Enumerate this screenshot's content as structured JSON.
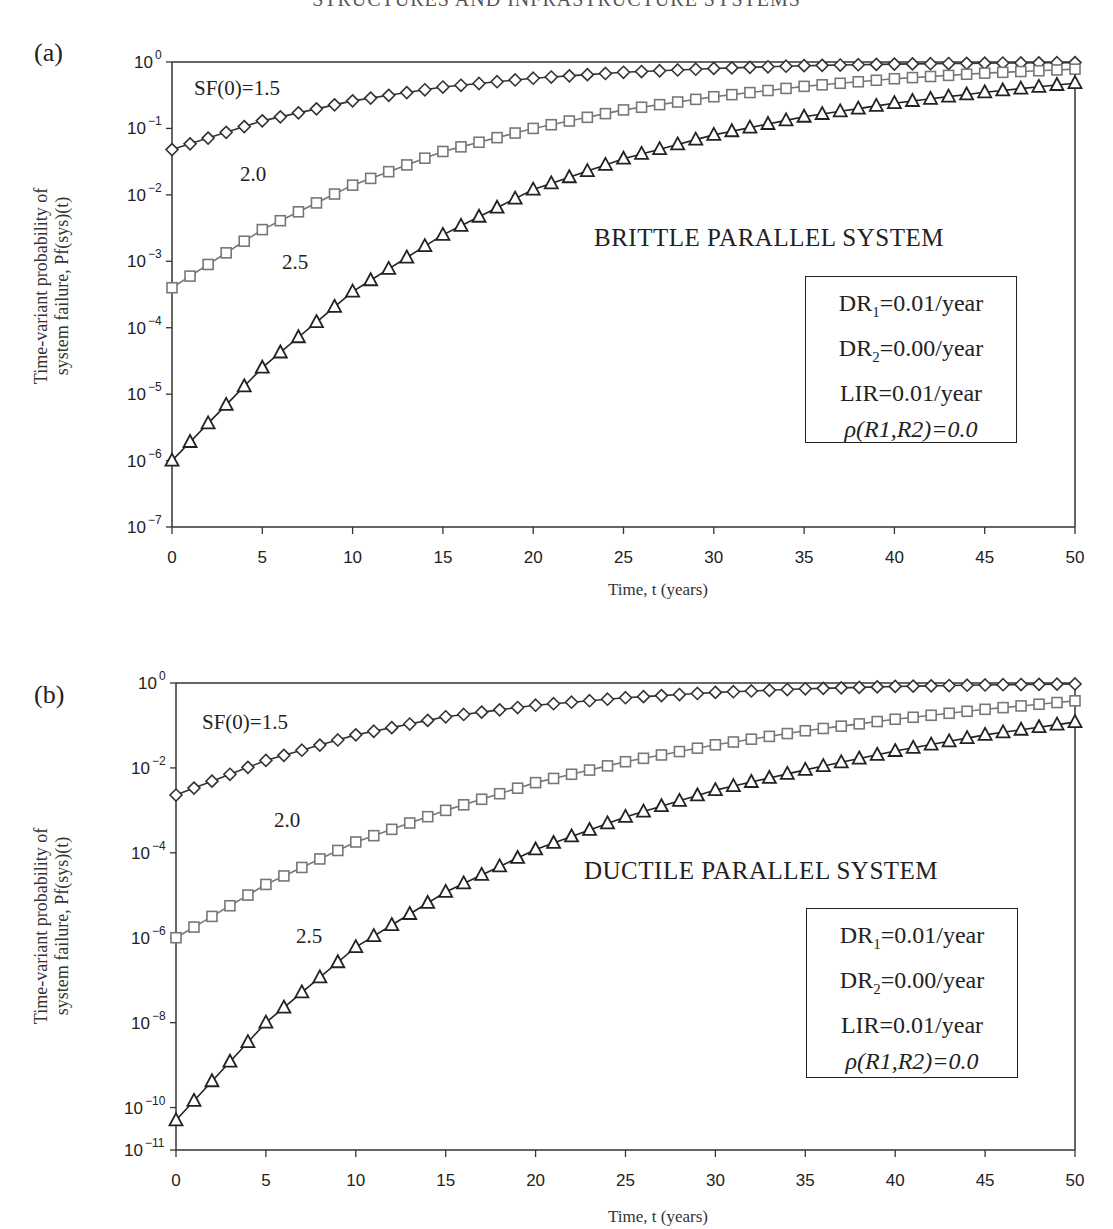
{
  "header": {
    "running_title": "STRUCTURES AND INFRASTRUCTURE SYSTEMS"
  },
  "panels": [
    {
      "id": "a",
      "label": "(a)",
      "system_title": "BRITTLE PARALLEL SYSTEM",
      "ylabel_line1": "Time-variant probability of",
      "ylabel_line2": "system failure, Pf(sys)(t)",
      "xlabel": "Time, t (years)",
      "series_labels": [
        "SF(0)=1.5",
        "2.0",
        "2.5"
      ],
      "params": {
        "dr1_prefix": "DR",
        "dr1_sub": "1",
        "dr1_value": "=0.01/year",
        "dr2_prefix": "DR",
        "dr2_sub": "2",
        "dr2_value": "=0.00/year",
        "lir": "LIR=0.01/year",
        "rho": "ρ(R1,R2)=0.0"
      },
      "yticks": [
        "10^0",
        "10^-1",
        "10^-2",
        "10^-3",
        "10^-4",
        "10^-5",
        "10^-6",
        "10^-7"
      ],
      "xticks": [
        "0",
        "5",
        "10",
        "15",
        "20",
        "25",
        "30",
        "35",
        "40",
        "45",
        "50"
      ]
    },
    {
      "id": "b",
      "label": "(b)",
      "system_title": "DUCTILE PARALLEL SYSTEM",
      "ylabel_line1": "Time-variant probability of",
      "ylabel_line2": "system failure, Pf(sys)(t)",
      "xlabel": "Time, t (years)",
      "series_labels": [
        "SF(0)=1.5",
        "2.0",
        "2.5"
      ],
      "params": {
        "dr1_prefix": "DR",
        "dr1_sub": "1",
        "dr1_value": "=0.01/year",
        "dr2_prefix": "DR",
        "dr2_sub": "2",
        "dr2_value": "=0.00/year",
        "lir": "LIR=0.01/year",
        "rho": "ρ(R1,R2)=0.0"
      },
      "yticks": [
        "10^0",
        "10^-2",
        "10^-4",
        "10^-6",
        "10^-8",
        "10^-10",
        "10^-11"
      ],
      "xticks": [
        "0",
        "5",
        "10",
        "15",
        "20",
        "25",
        "30",
        "35",
        "40",
        "45",
        "50"
      ]
    }
  ],
  "chart_data": [
    {
      "type": "line",
      "title": "(a) BRITTLE PARALLEL SYSTEM",
      "xlabel": "Time, t (years)",
      "ylabel": "Time-variant probability of system failure, Pf(sys)(t)",
      "yscale": "log",
      "xlim": [
        0,
        50
      ],
      "ylim": [
        1e-07,
        1
      ],
      "grid": false,
      "legend": "inline labels",
      "annotations": [
        "BRITTLE PARALLEL SYSTEM",
        "DR1=0.01/year",
        "DR2=0.00/year",
        "LIR=0.01/year",
        "ρ(R1,R2)=0.0"
      ],
      "x": [
        0,
        5,
        10,
        15,
        20,
        25,
        30,
        35,
        40,
        45,
        50
      ],
      "series": [
        {
          "name": "SF(0)=1.5",
          "marker": "diamond",
          "color": "#333333",
          "values": [
            0.048,
            0.13,
            0.26,
            0.42,
            0.57,
            0.7,
            0.8,
            0.88,
            0.93,
            0.96,
            0.98
          ]
        },
        {
          "name": "SF(0)=2.0",
          "marker": "square",
          "color": "#777777",
          "values": [
            0.0004,
            0.003,
            0.014,
            0.045,
            0.1,
            0.19,
            0.3,
            0.43,
            0.56,
            0.68,
            0.78
          ]
        },
        {
          "name": "SF(0)=2.5",
          "marker": "triangle",
          "color": "#222222",
          "values": [
            1e-06,
            2.5e-05,
            0.00035,
            0.0025,
            0.012,
            0.035,
            0.08,
            0.15,
            0.24,
            0.35,
            0.48
          ]
        }
      ]
    },
    {
      "type": "line",
      "title": "(b) DUCTILE PARALLEL SYSTEM",
      "xlabel": "Time, t (years)",
      "ylabel": "Time-variant probability of system failure, Pf(sys)(t)",
      "yscale": "log",
      "xlim": [
        0,
        50
      ],
      "ylim": [
        1e-11,
        1
      ],
      "grid": false,
      "legend": "inline labels",
      "annotations": [
        "DUCTILE PARALLEL SYSTEM",
        "DR1=0.01/year",
        "DR2=0.00/year",
        "LIR=0.01/year",
        "ρ(R1,R2)=0.0"
      ],
      "x": [
        0,
        5,
        10,
        15,
        20,
        25,
        30,
        35,
        40,
        45,
        50
      ],
      "series": [
        {
          "name": "SF(0)=1.5",
          "marker": "diamond",
          "color": "#333333",
          "values": [
            0.0023,
            0.015,
            0.06,
            0.16,
            0.3,
            0.45,
            0.6,
            0.73,
            0.83,
            0.9,
            0.95
          ]
        },
        {
          "name": "SF(0)=2.0",
          "marker": "square",
          "color": "#777777",
          "values": [
            1e-06,
            1.8e-05,
            0.00018,
            0.001,
            0.0045,
            0.014,
            0.035,
            0.075,
            0.14,
            0.24,
            0.38
          ]
        },
        {
          "name": "SF(0)=2.5",
          "marker": "triangle",
          "color": "#222222",
          "values": [
            5e-11,
            1e-08,
            6e-07,
            1.2e-05,
            0.00012,
            0.0007,
            0.003,
            0.009,
            0.025,
            0.06,
            0.12
          ]
        }
      ]
    }
  ]
}
